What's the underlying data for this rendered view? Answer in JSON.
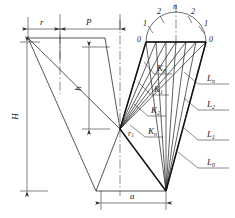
{
  "figure": {
    "stroke_color": "#2b2b2b",
    "thick_stroke_color": "#111111",
    "background": "#ffffff"
  },
  "dimensions": [
    {
      "key": "r",
      "label": "r",
      "position": "top-left-segment"
    },
    {
      "key": "P",
      "label": "P",
      "position": "top-right-segment"
    },
    {
      "key": "H",
      "label": "H",
      "position": "left-vertical"
    },
    {
      "key": "h",
      "label": "h",
      "position": "center-vertical"
    },
    {
      "key": "a",
      "label": "a",
      "position": "bottom-horizontal"
    }
  ],
  "radius_label": {
    "label": "r",
    "sub": "1"
  },
  "semicircle_labels": {
    "left_outer": "0",
    "left_mid": "1",
    "left_inner": "2",
    "apex": "n",
    "right_inner": "2",
    "right_mid": "1",
    "right_outer": "0"
  },
  "k_labels": [
    {
      "base": "K",
      "sub": "0"
    },
    {
      "base": "K",
      "sub": "1"
    },
    {
      "base": "K",
      "sub": "2"
    },
    {
      "base": "K",
      "sub": "n"
    }
  ],
  "l_labels": [
    {
      "base": "L",
      "sub": "n"
    },
    {
      "base": "L",
      "sub": "2"
    },
    {
      "base": "L",
      "sub": "1"
    },
    {
      "base": "L",
      "sub": "0"
    }
  ]
}
